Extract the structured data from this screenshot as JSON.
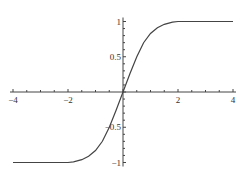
{
  "chart_data": {
    "type": "line",
    "title": "",
    "xlabel": "",
    "ylabel": "",
    "xlim": [
      -4,
      4
    ],
    "ylim": [
      -1,
      1
    ],
    "grid": false,
    "axes_style": "centered-at-origin",
    "x_ticks": [
      -4,
      -2,
      0,
      2,
      4
    ],
    "x_tick_labels": [
      "-4",
      "-2",
      "",
      "2",
      "4"
    ],
    "y_ticks": [
      -1,
      -0.5,
      0.5,
      1
    ],
    "y_tick_labels": [
      "-1",
      "-0.5",
      "0.5",
      "1"
    ],
    "line_color": "#444444",
    "series": [
      {
        "name": "f(x)",
        "x": [
          -4,
          -3,
          -2,
          -1.8,
          -1.5,
          -1.25,
          -1,
          -0.75,
          -0.5,
          -0.25,
          0,
          0.25,
          0.5,
          0.75,
          1,
          1.25,
          1.5,
          1.8,
          2,
          3,
          4
        ],
        "values": [
          -1,
          -1,
          -1,
          -0.99,
          -0.96,
          -0.91,
          -0.83,
          -0.7,
          -0.5,
          -0.26,
          0,
          0.26,
          0.5,
          0.7,
          0.83,
          0.91,
          0.96,
          0.99,
          1,
          1,
          1
        ]
      }
    ]
  }
}
